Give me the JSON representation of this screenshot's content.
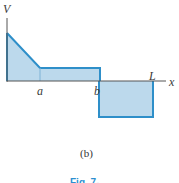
{
  "diagram": {
    "type": "shear-force-diagram",
    "axis_labels": {
      "vertical": "V",
      "horizontal": "x"
    },
    "points": {
      "a": "a",
      "b": "b",
      "L": "L"
    },
    "caption": "(b)",
    "figure_label_partial": "Fig. 7-",
    "colors": {
      "fill": "#bcd9ec",
      "stroke": "#2e8fc9",
      "axis": "#555555"
    },
    "segments": [
      {
        "from": "0",
        "to": "a",
        "shape": "linear-decreasing",
        "sign": "positive"
      },
      {
        "from": "a",
        "to": "b",
        "shape": "constant",
        "sign": "positive"
      },
      {
        "from": "b",
        "to": "L",
        "shape": "constant",
        "sign": "negative"
      }
    ]
  }
}
